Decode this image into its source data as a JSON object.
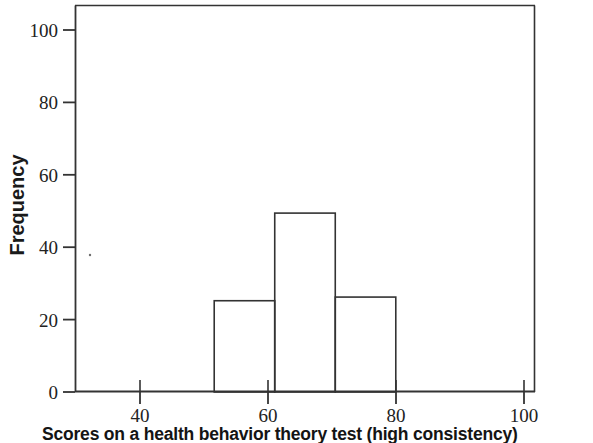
{
  "figure": {
    "caption": "Scores on a health behavior theory test (high consistency)",
    "background_color": "#ffffff",
    "line_color": "#333333"
  },
  "axes": {
    "y_title": "Frequency",
    "x_ticks": [
      "40",
      "60",
      "80",
      "100"
    ],
    "y_ticks": [
      "0",
      "20",
      "40",
      "60",
      "80",
      "100"
    ]
  },
  "chart_data": {
    "type": "bar",
    "title": "",
    "xlabel": "Scores on a health behavior theory test (high consistency)",
    "ylabel": "Frequency",
    "categories": [
      "55-65",
      "65-75",
      "75-85"
    ],
    "bin_edges": [
      55,
      65,
      75,
      85
    ],
    "values": [
      25,
      49,
      26
    ],
    "xlim": [
      32,
      108
    ],
    "ylim": [
      0,
      106
    ],
    "xticks": [
      40,
      60,
      80,
      100
    ],
    "yticks": [
      0,
      20,
      40,
      60,
      80,
      100
    ],
    "grid": false,
    "legend": "none",
    "bar_fill": "none",
    "bar_stroke": "#333333"
  }
}
